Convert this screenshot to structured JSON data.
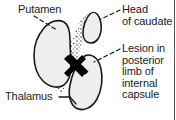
{
  "figure": {
    "kind": "anatomical-diagram",
    "background_color": "#ffffff",
    "outline_color": "#1a1a1a",
    "fill_color": "#eeeeee",
    "stipple_color": "#3a3a3a",
    "lesion_color": "#000000",
    "border_color": "#555555"
  },
  "labels": {
    "putamen": "Putamen",
    "head_of_caudate": "Head\nof caudate",
    "lesion": "Lesion in\nposterior\nlimb of\ninternal\ncapsule",
    "thalamus": "Thalamus"
  },
  "structures": [
    {
      "name": "putamen",
      "shape": "large ovoid blob",
      "position": "left-center"
    },
    {
      "name": "head-of-caudate",
      "shape": "small kidney-bean blob",
      "position": "upper-right"
    },
    {
      "name": "thalamus",
      "shape": "elongated ovoid blob",
      "position": "lower-right"
    },
    {
      "name": "internal-capsule",
      "shape": "stippled V-shaped band",
      "position": "center"
    },
    {
      "name": "lesion-marker",
      "shape": "black X",
      "position": "center, genu of internal capsule"
    }
  ],
  "leader_lines": [
    {
      "name": "putamen-leader",
      "style": "dashed"
    },
    {
      "name": "head-of-caudate-leader",
      "style": "dashed"
    },
    {
      "name": "lesion-leader",
      "style": "dashed"
    },
    {
      "name": "thalamus-leader",
      "style": "solid"
    }
  ]
}
